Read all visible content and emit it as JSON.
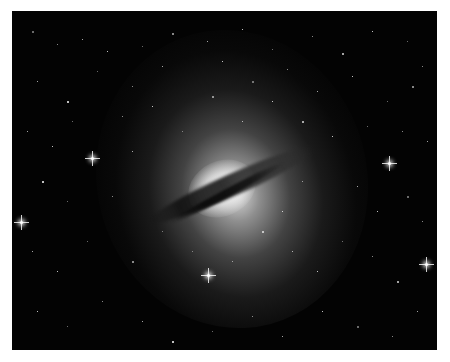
{
  "image": {
    "subject": "Centaurus A galaxy with dust lane in star field",
    "alt": "Astronomical photograph of an elliptical galaxy with a dark diagonal dust lane, surrounded by stars",
    "colors": {
      "background": "#ffffff",
      "space": "#030303",
      "glow": "#e6e6e6"
    }
  },
  "bright_stars": [
    {
      "x": 79,
      "y": 146
    },
    {
      "x": 8,
      "y": 210
    },
    {
      "x": 195,
      "y": 263
    },
    {
      "x": 376,
      "y": 151
    },
    {
      "x": 413,
      "y": 252
    }
  ],
  "stars": [
    [
      20,
      20
    ],
    [
      45,
      33
    ],
    [
      70,
      28
    ],
    [
      95,
      40
    ],
    [
      130,
      35
    ],
    [
      160,
      22
    ],
    [
      195,
      30
    ],
    [
      230,
      18
    ],
    [
      260,
      38
    ],
    [
      300,
      25
    ],
    [
      330,
      42
    ],
    [
      360,
      20
    ],
    [
      395,
      30
    ],
    [
      410,
      55
    ],
    [
      25,
      70
    ],
    [
      55,
      90
    ],
    [
      85,
      60
    ],
    [
      120,
      75
    ],
    [
      150,
      55
    ],
    [
      210,
      50
    ],
    [
      240,
      70
    ],
    [
      275,
      58
    ],
    [
      305,
      80
    ],
    [
      340,
      65
    ],
    [
      375,
      90
    ],
    [
      400,
      75
    ],
    [
      15,
      120
    ],
    [
      40,
      135
    ],
    [
      60,
      110
    ],
    [
      110,
      105
    ],
    [
      290,
      110
    ],
    [
      320,
      125
    ],
    [
      355,
      115
    ],
    [
      390,
      120
    ],
    [
      415,
      130
    ],
    [
      30,
      170
    ],
    [
      55,
      190
    ],
    [
      100,
      185
    ],
    [
      345,
      175
    ],
    [
      365,
      200
    ],
    [
      395,
      185
    ],
    [
      410,
      210
    ],
    [
      20,
      240
    ],
    [
      45,
      260
    ],
    [
      75,
      230
    ],
    [
      120,
      250
    ],
    [
      280,
      240
    ],
    [
      305,
      260
    ],
    [
      330,
      230
    ],
    [
      360,
      245
    ],
    [
      385,
      270
    ],
    [
      25,
      300
    ],
    [
      55,
      315
    ],
    [
      90,
      290
    ],
    [
      130,
      310
    ],
    [
      160,
      330
    ],
    [
      200,
      320
    ],
    [
      240,
      305
    ],
    [
      270,
      325
    ],
    [
      310,
      300
    ],
    [
      345,
      315
    ],
    [
      380,
      325
    ],
    [
      405,
      300
    ],
    [
      140,
      95
    ],
    [
      170,
      120
    ],
    [
      200,
      85
    ],
    [
      230,
      110
    ],
    [
      260,
      90
    ],
    [
      180,
      240
    ],
    [
      220,
      250
    ],
    [
      250,
      220
    ],
    [
      270,
      200
    ],
    [
      150,
      220
    ],
    [
      290,
      170
    ],
    [
      120,
      140
    ]
  ]
}
